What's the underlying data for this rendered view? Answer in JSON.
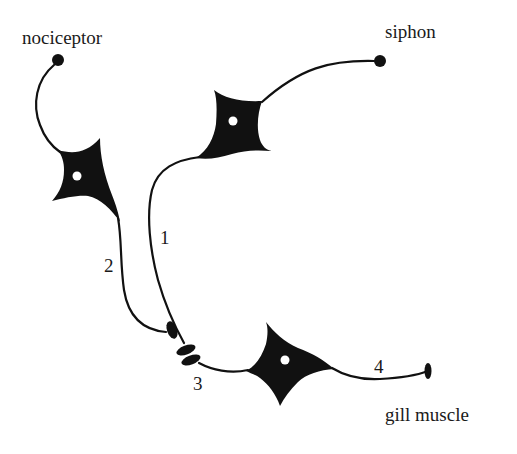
{
  "diagram": {
    "type": "neural circuit (Aplysia gill-withdrawal reflex)",
    "labels": {
      "nociceptor": "nociceptor",
      "siphon": "siphon",
      "gill_muscle": "gill muscle"
    },
    "numbers": {
      "n1": "1",
      "n2": "2",
      "n3": "3",
      "n4": "4"
    },
    "neurons": [
      {
        "id": "nociceptor-neuron",
        "receptor_label": "nociceptor",
        "pathway_number": "2"
      },
      {
        "id": "siphon-sensory-neuron",
        "receptor_label": "siphon",
        "pathway_number": "1"
      },
      {
        "id": "motor-neuron",
        "target_label": "gill muscle",
        "pathway_number": "4"
      }
    ],
    "synapse_number": "3",
    "colors": {
      "ink": "#111111",
      "background": "#ffffff"
    }
  }
}
